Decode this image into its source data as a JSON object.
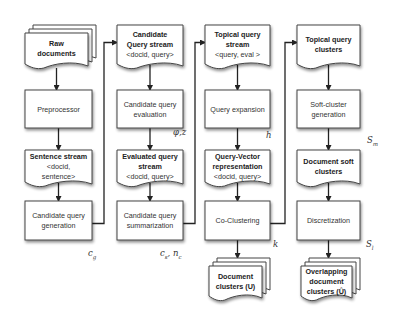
{
  "diagram": {
    "type": "flowchart",
    "columns": [
      {
        "nodes": [
          {
            "id": "raw-documents",
            "shape": "multi-document",
            "lines": [
              "Raw",
              "documents"
            ],
            "bold": true
          },
          {
            "id": "preprocessor",
            "shape": "process",
            "lines": [
              "Preprocessor"
            ],
            "bold": false
          },
          {
            "id": "sentence-stream",
            "shape": "document",
            "lines": [
              "Sentence stream",
              "<docid,",
              "sentence>"
            ],
            "bold_first": true
          },
          {
            "id": "candidate-query-generation",
            "shape": "process",
            "lines": [
              "Candidate query",
              "generation"
            ],
            "bold": false
          }
        ],
        "param": {
          "base": "c",
          "sub": "g"
        }
      },
      {
        "nodes": [
          {
            "id": "candidate-query-stream",
            "shape": "document",
            "lines": [
              "Candidate",
              "Query stream",
              "<docid, query>"
            ],
            "bold_count": 2
          },
          {
            "id": "candidate-query-evaluation",
            "shape": "process",
            "lines": [
              "Candidate query",
              "evaluation"
            ],
            "bold": false
          },
          {
            "id": "evaluated-query-stream",
            "shape": "document",
            "lines": [
              "Evaluated query",
              "stream",
              "<docid, query>"
            ],
            "bold_count": 2
          },
          {
            "id": "candidate-query-summarization",
            "shape": "process",
            "lines": [
              "Candidate query",
              "summarization"
            ],
            "bold": false
          }
        ],
        "param_mid": "φ,z",
        "param": {
          "base": "c",
          "sub": "s",
          "extra_base": "n",
          "extra_sub": "c"
        }
      },
      {
        "nodes": [
          {
            "id": "topical-query-stream",
            "shape": "document",
            "lines": [
              "Topical query",
              "stream",
              "<query, eval >"
            ],
            "bold_count": 2
          },
          {
            "id": "query-expansion",
            "shape": "process",
            "lines": [
              "Query expansion"
            ],
            "bold": false
          },
          {
            "id": "query-vector-representation",
            "shape": "document",
            "lines": [
              "Query-Vector",
              "representation",
              "<docid, query>"
            ],
            "bold_count": 2
          },
          {
            "id": "co-clustering",
            "shape": "process",
            "lines": [
              "Co-Clustering"
            ],
            "bold": false
          },
          {
            "id": "document-clusters",
            "shape": "multi-document",
            "lines": [
              "Document",
              "clusters (U)"
            ],
            "bold": true
          }
        ],
        "param_mid": "h",
        "param": {
          "base": "k"
        }
      },
      {
        "nodes": [
          {
            "id": "topical-query-clusters",
            "shape": "document",
            "lines": [
              "Topical query",
              "clusters"
            ],
            "bold_count": 2
          },
          {
            "id": "soft-cluster-generation",
            "shape": "process",
            "lines": [
              "Soft-cluster",
              "generation"
            ],
            "bold": false
          },
          {
            "id": "document-soft-clusters",
            "shape": "document",
            "lines": [
              "Document soft",
              "clusters"
            ],
            "bold_count": 2
          },
          {
            "id": "discretization",
            "shape": "process",
            "lines": [
              "Discretization"
            ],
            "bold": false
          },
          {
            "id": "overlapping-document-clusters",
            "shape": "multi-document",
            "lines": [
              "Overlapping",
              "document",
              "clusters (Û)"
            ],
            "bold": true
          }
        ],
        "param_mid": {
          "base": "S",
          "sub": "m"
        },
        "param": {
          "base": "S",
          "sub": "l"
        }
      }
    ],
    "edges": [
      [
        "raw-documents",
        "preprocessor"
      ],
      [
        "preprocessor",
        "sentence-stream"
      ],
      [
        "sentence-stream",
        "candidate-query-generation"
      ],
      [
        "candidate-query-generation",
        "candidate-query-stream"
      ],
      [
        "candidate-query-stream",
        "candidate-query-evaluation"
      ],
      [
        "candidate-query-evaluation",
        "evaluated-query-stream"
      ],
      [
        "evaluated-query-stream",
        "candidate-query-summarization"
      ],
      [
        "candidate-query-summarization",
        "topical-query-stream"
      ],
      [
        "topical-query-stream",
        "query-expansion"
      ],
      [
        "query-expansion",
        "query-vector-representation"
      ],
      [
        "query-vector-representation",
        "co-clustering"
      ],
      [
        "co-clustering",
        "document-clusters"
      ],
      [
        "co-clustering",
        "topical-query-clusters"
      ],
      [
        "topical-query-clusters",
        "soft-cluster-generation"
      ],
      [
        "soft-cluster-generation",
        "document-soft-clusters"
      ],
      [
        "document-soft-clusters",
        "discretization"
      ],
      [
        "discretization",
        "overlapping-document-clusters"
      ]
    ]
  }
}
